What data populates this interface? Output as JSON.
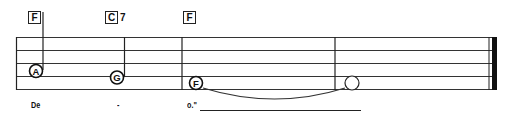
{
  "chords": [
    {
      "root": "F",
      "ext": "",
      "x": 28
    },
    {
      "root": "C",
      "ext": "7",
      "x": 105
    },
    {
      "root": "F",
      "ext": "",
      "x": 183
    }
  ],
  "notes": [
    {
      "letter": "A",
      "x": 36,
      "y": 71,
      "stem": "up",
      "filled_letter": true
    },
    {
      "letter": "G",
      "x": 117,
      "y": 78,
      "stem": "up",
      "filled_letter": true
    },
    {
      "letter": "F",
      "x": 196,
      "y": 83,
      "stem": "none",
      "filled_letter": true
    },
    {
      "letter": "",
      "x": 352,
      "y": 83,
      "stem": "none",
      "filled_letter": false
    }
  ],
  "lyrics": [
    {
      "text": "De",
      "x": 31
    },
    {
      "text": "-",
      "x": 117
    },
    {
      "text": "o.\"",
      "x": 187
    }
  ],
  "colors": {
    "ink": "#222222",
    "background": "#ffffff"
  }
}
